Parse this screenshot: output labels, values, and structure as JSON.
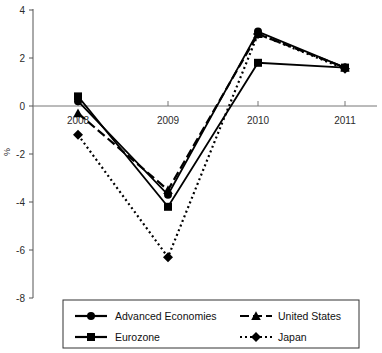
{
  "chart_data": {
    "type": "line",
    "title": "",
    "subtitle": "",
    "xlabel": "",
    "ylabel": "%",
    "categories": [
      "2008",
      "2009",
      "2010",
      "2011"
    ],
    "x": [
      2008,
      2009,
      2010,
      2011
    ],
    "ylim": [
      -8,
      4
    ],
    "yticks": [
      4,
      2,
      0,
      -2,
      -4,
      -6,
      -8
    ],
    "ytick_labels": [
      "4",
      "2",
      "0",
      "-2",
      "-4",
      "-6",
      "-8"
    ],
    "grid": false,
    "legend_position": "bottom",
    "zero_line": 0,
    "series": [
      {
        "name": "Advanced Economies",
        "marker": "circle",
        "line_style": "solid",
        "color": "#000000",
        "values": [
          0.2,
          -3.7,
          3.1,
          1.6
        ]
      },
      {
        "name": "United States",
        "marker": "triangle",
        "line_style": "dashed",
        "color": "#000000",
        "values": [
          -0.3,
          -3.5,
          3.0,
          1.6
        ]
      },
      {
        "name": "Eurozone",
        "marker": "square",
        "line_style": "solid",
        "color": "#000000",
        "values": [
          0.4,
          -4.2,
          1.8,
          1.6
        ]
      },
      {
        "name": "Japan",
        "marker": "diamond",
        "line_style": "dotted",
        "color": "#000000",
        "values": [
          -1.2,
          -6.3,
          3.0,
          1.55
        ]
      }
    ]
  },
  "axes": {
    "y_label": "%",
    "y_ticks": [
      "4",
      "2",
      "0",
      "-2",
      "-4",
      "-6",
      "-8"
    ],
    "x_ticks": [
      "2008",
      "2009",
      "2010",
      "2011"
    ]
  },
  "legend": {
    "entries": [
      {
        "label": "Advanced Economies",
        "marker": "circle-marker",
        "dash": "solid"
      },
      {
        "label": "United States",
        "marker": "triangle-marker",
        "dash": "dashed"
      },
      {
        "label": "Eurozone",
        "marker": "square-marker",
        "dash": "solid"
      },
      {
        "label": "Japan",
        "marker": "diamond-marker",
        "dash": "dotted"
      }
    ]
  },
  "colors": {
    "ink": "#000000",
    "axis": "#555555",
    "background": "#ffffff"
  }
}
